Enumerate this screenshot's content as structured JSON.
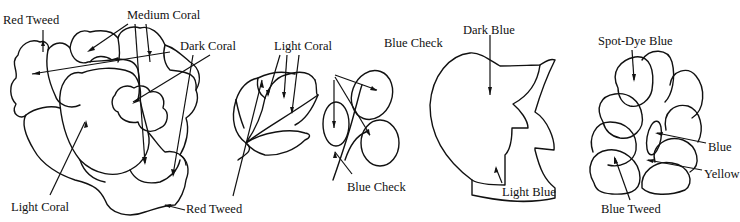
{
  "diagram": {
    "type": "rug hooking color key line drawings",
    "motifs": [
      {
        "name": "rose",
        "labels": [
          {
            "id": "red-tweed-top",
            "text": "Red Tweed",
            "x": 3,
            "y": 14
          },
          {
            "id": "medium-coral",
            "text": "Medium Coral",
            "x": 127,
            "y": 9
          },
          {
            "id": "dark-coral",
            "text": "Dark Coral",
            "x": 180,
            "y": 40
          },
          {
            "id": "light-coral-rose",
            "text": "Light Coral",
            "x": 11,
            "y": 201
          },
          {
            "id": "red-tweed-bottom",
            "text": "Red Tweed",
            "x": 186,
            "y": 203
          }
        ]
      },
      {
        "name": "bud",
        "labels": [
          {
            "id": "light-coral-bud",
            "text": "Light Coral",
            "x": 274,
            "y": 40
          }
        ]
      },
      {
        "name": "berries",
        "labels": [
          {
            "id": "blue-check-top",
            "text": "Blue Check",
            "x": 384,
            "y": 37
          },
          {
            "id": "blue-check-bottom",
            "text": "Blue Check",
            "x": 347,
            "y": 181
          }
        ]
      },
      {
        "name": "leaf",
        "labels": [
          {
            "id": "dark-blue",
            "text": "Dark Blue",
            "x": 463,
            "y": 24
          },
          {
            "id": "light-blue",
            "text": "Light Blue",
            "x": 502,
            "y": 186
          }
        ]
      },
      {
        "name": "grape-cluster",
        "labels": [
          {
            "id": "spot-dye-blue",
            "text": "Spot-Dye Blue",
            "x": 598,
            "y": 35
          },
          {
            "id": "blue",
            "text": "Blue",
            "x": 708,
            "y": 141
          },
          {
            "id": "yellow",
            "text": "Yellow",
            "x": 704,
            "y": 168
          },
          {
            "id": "blue-tweed",
            "text": "Blue Tweed",
            "x": 601,
            "y": 203
          }
        ]
      }
    ]
  }
}
